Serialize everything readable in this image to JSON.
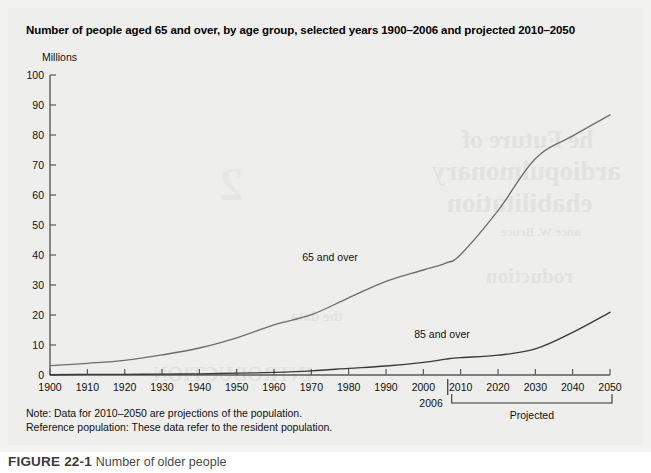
{
  "figure": {
    "title": "Number of people aged 65 and over, by age group, selected years 1900–2006 and projected 2010–2050",
    "notes": [
      "Note: Data for 2010–2050 are projections of the population.",
      "Reference population: These data refer to the resident population."
    ],
    "caption_label": "FIGURE 22-1",
    "caption_body": "Number of older people",
    "panel_bg": "#eeeeec",
    "page_bg": "#ffffff"
  },
  "ghost_text": {
    "line1": "he Future of",
    "line2": "ardiopulmonary",
    "line3": "ehabilitation",
    "line4": "ance W. Bruce",
    "line5": "roduction",
    "line6": "2",
    "line7": "INTRODUCTION",
    "line8": "the data"
  },
  "chart_data": {
    "type": "line",
    "title": "Number of people aged 65 and over, by age group, selected years 1900–2006 and projected 2010–2050",
    "xlabel": "",
    "ylabel": "Millions",
    "ylim": [
      0,
      100
    ],
    "ytick_step": 10,
    "yticks": [
      0,
      10,
      20,
      30,
      40,
      50,
      60,
      70,
      80,
      90,
      100
    ],
    "xlim": [
      1900,
      2050
    ],
    "xticks": [
      1900,
      1910,
      1920,
      1930,
      1940,
      1950,
      1960,
      1970,
      1980,
      1990,
      2000,
      2010,
      2020,
      2030,
      2040,
      2050
    ],
    "grid": false,
    "legend_position": "inline-labels",
    "line_color_65": "#6e6e6e",
    "line_color_85": "#3a3a3a",
    "axis_color": "#5a5a5a",
    "divider_year": 2006,
    "divider_label": "2006",
    "projected_label": "Projected",
    "projected_range": [
      2010,
      2050
    ],
    "series": [
      {
        "name": "65 and over",
        "label": "65 and over",
        "label_x": 1975,
        "label_y": 38,
        "color": "#6e6e6e",
        "x": [
          1900,
          1910,
          1920,
          1930,
          1940,
          1950,
          1960,
          1970,
          1980,
          1990,
          2000,
          2006,
          2010,
          2020,
          2030,
          2040,
          2050
        ],
        "values": [
          3.1,
          3.9,
          4.9,
          6.7,
          9.0,
          12.4,
          16.7,
          20.1,
          25.7,
          31.2,
          35.0,
          37.3,
          40.2,
          54.8,
          72.1,
          79.7,
          86.7
        ]
      },
      {
        "name": "85 and over",
        "label": "85 and over",
        "label_x": 2005,
        "label_y": 12.5,
        "color": "#3a3a3a",
        "x": [
          1900,
          1910,
          1920,
          1930,
          1940,
          1950,
          1960,
          1970,
          1980,
          1990,
          2000,
          2006,
          2010,
          2020,
          2030,
          2040,
          2050
        ],
        "values": [
          0.1,
          0.2,
          0.2,
          0.3,
          0.4,
          0.6,
          0.9,
          1.4,
          2.2,
          3.0,
          4.2,
          5.3,
          5.8,
          6.6,
          8.7,
          14.2,
          20.9
        ]
      }
    ]
  }
}
